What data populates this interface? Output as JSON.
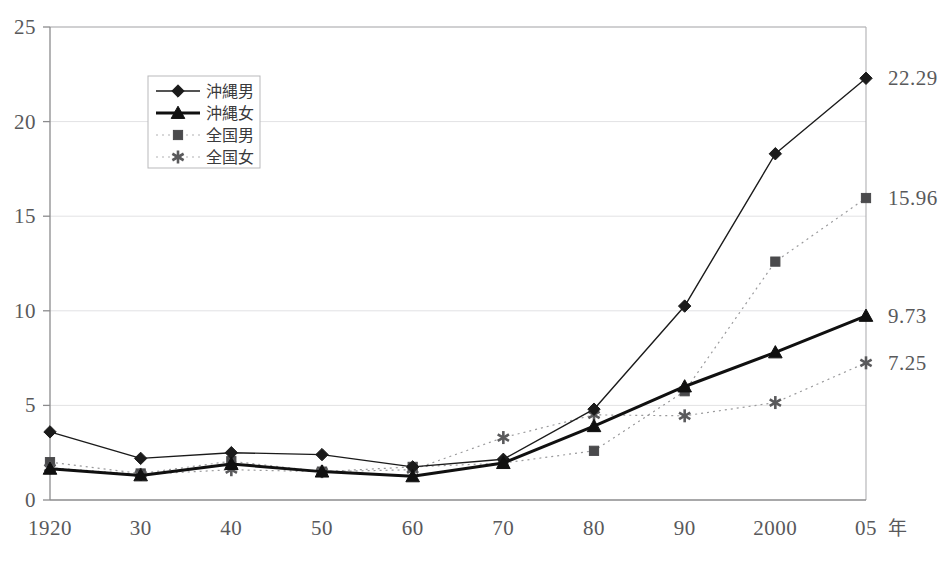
{
  "chart_data": {
    "type": "line",
    "title": "",
    "subtitle": "",
    "xlabel": "年",
    "ylabel": "",
    "x": [
      1920,
      1930,
      1940,
      1950,
      1960,
      1970,
      1980,
      1990,
      2000,
      2005
    ],
    "categories": [
      "1920",
      "30",
      "40",
      "50",
      "60",
      "70",
      "80",
      "90",
      "2000",
      "05"
    ],
    "xtick_labels": [
      "1920",
      "30",
      "40",
      "50",
      "60",
      "70",
      "80",
      "90",
      "2000",
      "05"
    ],
    "x_unit_label": "年",
    "ytick_labels": [
      "0",
      "5",
      "10",
      "15",
      "20",
      "25"
    ],
    "yticks": [
      0,
      5,
      10,
      15,
      20,
      25
    ],
    "ylim": [
      0,
      25
    ],
    "grid": "horizontal-faint",
    "legend_position": "top-left-inside",
    "series": [
      {
        "name": "沖縄男",
        "marker": "diamond",
        "line_style": "solid",
        "line_width": 1.4,
        "color": "#1b1b1b",
        "values": [
          3.6,
          2.2,
          2.5,
          2.4,
          1.75,
          2.15,
          4.8,
          10.25,
          18.3,
          22.29
        ],
        "end_label": "22.29"
      },
      {
        "name": "沖縄女",
        "marker": "triangle",
        "line_style": "solid",
        "line_width": 3.0,
        "color": "#101010",
        "values": [
          1.65,
          1.3,
          1.9,
          1.5,
          1.25,
          1.95,
          3.9,
          6.0,
          7.8,
          9.73
        ],
        "end_label": "9.73"
      },
      {
        "name": "全国男",
        "marker": "square",
        "line_style": "dotted",
        "line_width": 1.2,
        "color": "#4a4a4c",
        "values": [
          2.0,
          1.4,
          2.05,
          1.5,
          1.75,
          1.95,
          2.6,
          5.75,
          12.6,
          15.96
        ],
        "end_label": "15.96"
      },
      {
        "name": "全国女",
        "marker": "asterisk",
        "line_style": "dotted",
        "line_width": 1.2,
        "color": "#5a5a5c",
        "values": [
          1.7,
          1.35,
          1.6,
          1.5,
          1.6,
          3.3,
          4.5,
          4.45,
          5.15,
          7.25
        ],
        "end_label": "7.25"
      }
    ],
    "end_labels": [
      "22.29",
      "15.96",
      "9.73",
      "7.25"
    ],
    "axis_color": "#8b8b8d",
    "grid_color": "#e2e2e4",
    "background": "#ffffff"
  },
  "legend": {
    "items": [
      {
        "label": "沖縄男",
        "marker": "diamond-icon",
        "style": "solid-thin"
      },
      {
        "label": "沖縄女",
        "marker": "triangle-icon",
        "style": "solid-thick"
      },
      {
        "label": "全国男",
        "marker": "square-icon",
        "style": "dotted"
      },
      {
        "label": "全国女",
        "marker": "asterisk-icon",
        "style": "dotted"
      }
    ]
  }
}
